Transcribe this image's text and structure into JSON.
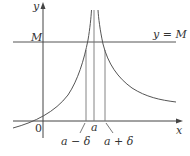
{
  "figure": {
    "labels": {
      "y_axis": "y",
      "x_axis": "x",
      "origin": "0",
      "m_tick": "M",
      "line_label": "y = M",
      "a": "a",
      "a_minus_delta": "a − δ",
      "a_plus_delta": "a + δ"
    },
    "colors": {
      "axis": "#444444",
      "curve": "#555555",
      "guide": "#777777",
      "background": "#ffffff"
    }
  }
}
